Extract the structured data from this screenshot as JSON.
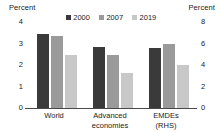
{
  "axes": {
    "left_caption": "Percent",
    "right_caption": "Percent",
    "left_ticks": [
      "4",
      "3",
      "2",
      "1",
      "0"
    ],
    "right_ticks": [
      "8",
      "6",
      "4",
      "2",
      "0"
    ]
  },
  "legend": {
    "items": [
      {
        "label": "2000",
        "color": "#3a3a3a"
      },
      {
        "label": "2007",
        "color": "#9a9a9a"
      },
      {
        "label": "2019",
        "color": "#c8c8c8"
      }
    ]
  },
  "categories": [
    {
      "label": "World"
    },
    {
      "label": "Advanced\neconomies"
    },
    {
      "label": "EMDEs\n(RHS)"
    }
  ],
  "chart_data": {
    "type": "bar",
    "title": "",
    "xlabel": "",
    "ylabel": "Percent",
    "y2label": "Percent",
    "ylim": [
      0,
      4
    ],
    "y2lim": [
      0,
      8
    ],
    "yticks": [
      0,
      1,
      2,
      3,
      4
    ],
    "y2ticks": [
      0,
      2,
      4,
      6,
      8
    ],
    "grid": false,
    "legend_position": "top-center",
    "categories": [
      "World",
      "Advanced economies",
      "EMDEs (RHS)"
    ],
    "axis_assignment": [
      "left",
      "left",
      "right"
    ],
    "series": [
      {
        "name": "2000",
        "color": "#3a3a3a",
        "values": [
          3.45,
          2.85,
          5.6
        ]
      },
      {
        "name": "2007",
        "color": "#9a9a9a",
        "values": [
          3.35,
          2.45,
          6.0
        ]
      },
      {
        "name": "2019",
        "color": "#c8c8c8",
        "values": [
          2.45,
          1.65,
          4.0
        ]
      }
    ]
  }
}
